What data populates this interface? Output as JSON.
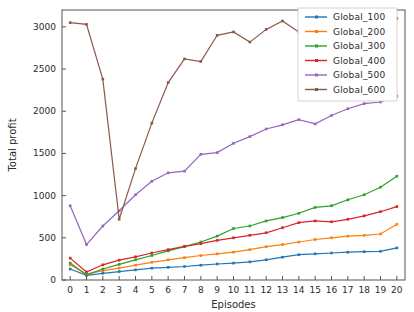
{
  "chart_data": {
    "type": "line",
    "title": "",
    "xlabel": "Episodes",
    "ylabel": "Total profit",
    "xlim": [
      -0.5,
      20.5
    ],
    "ylim": [
      0,
      3200
    ],
    "xticks": [
      0,
      1,
      2,
      3,
      4,
      5,
      6,
      7,
      8,
      9,
      10,
      11,
      12,
      13,
      14,
      15,
      16,
      17,
      18,
      19,
      20
    ],
    "yticks": [
      0,
      500,
      1000,
      1500,
      2000,
      2500,
      3000
    ],
    "grid": false,
    "legend_position": "upper right",
    "x": [
      0,
      1,
      2,
      3,
      4,
      5,
      6,
      7,
      8,
      9,
      10,
      11,
      12,
      13,
      14,
      15,
      16,
      17,
      18,
      19,
      20
    ],
    "series": [
      {
        "name": "Global_100",
        "color": "#1f77b4",
        "values": [
          130,
          55,
          80,
          100,
          120,
          140,
          150,
          160,
          175,
          190,
          200,
          215,
          240,
          270,
          300,
          310,
          320,
          330,
          335,
          340,
          380
        ]
      },
      {
        "name": "Global_200",
        "color": "#ff7f0e",
        "values": [
          180,
          70,
          110,
          140,
          175,
          210,
          240,
          265,
          290,
          310,
          330,
          360,
          395,
          420,
          450,
          480,
          500,
          520,
          530,
          545,
          660
        ]
      },
      {
        "name": "Global_300",
        "color": "#2ca02c",
        "values": [
          200,
          60,
          130,
          185,
          240,
          290,
          345,
          395,
          450,
          520,
          610,
          640,
          700,
          740,
          790,
          860,
          880,
          950,
          1010,
          1100,
          1230
        ]
      },
      {
        "name": "Global_400",
        "color": "#d62728",
        "values": [
          260,
          95,
          180,
          235,
          275,
          320,
          360,
          400,
          430,
          470,
          500,
          530,
          560,
          620,
          680,
          700,
          690,
          720,
          760,
          810,
          870
        ]
      },
      {
        "name": "Global_500",
        "color": "#9467bd",
        "values": [
          880,
          420,
          640,
          820,
          1010,
          1170,
          1270,
          1290,
          1490,
          1510,
          1620,
          1700,
          1790,
          1840,
          1900,
          1850,
          1950,
          2030,
          2090,
          2110,
          2180
        ]
      },
      {
        "name": "Global_600",
        "color": "#8c564b",
        "values": [
          3050,
          3030,
          2380,
          720,
          1320,
          1860,
          2340,
          2620,
          2590,
          2900,
          2940,
          2820,
          2970,
          3070,
          2940,
          3110,
          3080,
          3070,
          3060,
          3080,
          3100
        ]
      }
    ]
  }
}
